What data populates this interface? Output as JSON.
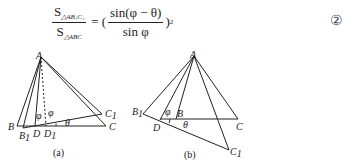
{
  "formula": {
    "num_prefix": "S",
    "num_sub": "△AB₁C₁",
    "den_prefix": "S",
    "den_sub": "△ABC",
    "equals": "=",
    "open_paren": "(",
    "inner_num": "sin(φ − θ)",
    "inner_den": "sin φ",
    "close_paren": ")",
    "exponent": "2",
    "equation_number": "②"
  },
  "figures": [
    {
      "caption": "(a)",
      "labels": {
        "A": "A",
        "B": "B",
        "B1": "B",
        "B1_sub": "1",
        "D": "D",
        "D1": "D",
        "D1_sub": "1",
        "C": "C",
        "C1": "C",
        "C1_sub": "1",
        "phi1": "φ",
        "phi2": "φ",
        "theta": "θ"
      }
    },
    {
      "caption": "(b)",
      "labels": {
        "A": "A",
        "B": "B",
        "B1": "B",
        "B1_sub": "1",
        "D": "D",
        "C": "C",
        "C1": "C",
        "C1_sub": "1",
        "phi": "φ",
        "theta": "θ"
      }
    }
  ]
}
